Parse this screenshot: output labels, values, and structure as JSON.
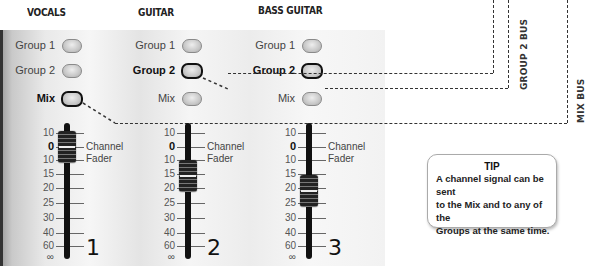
{
  "channels": [
    {
      "title": "VOCALS",
      "number": "1",
      "buttons": [
        {
          "label": "Group 1",
          "active": false
        },
        {
          "label": "Group 2",
          "active": false
        },
        {
          "label": "Mix",
          "active": true
        }
      ],
      "fader_label_line1": "Channel",
      "fader_label_line2": "Fader",
      "fader_position": "0"
    },
    {
      "title": "GUITAR",
      "number": "2",
      "buttons": [
        {
          "label": "Group 1",
          "active": false
        },
        {
          "label": "Group 2",
          "active": true
        },
        {
          "label": "Mix",
          "active": false
        }
      ],
      "fader_label_line1": "Channel",
      "fader_label_line2": "Fader",
      "fader_position": "15"
    },
    {
      "title": "BASS GUITAR",
      "number": "3",
      "buttons": [
        {
          "label": "Group 1",
          "active": false
        },
        {
          "label": "Group 2",
          "active": true
        },
        {
          "label": "Mix",
          "active": false
        }
      ],
      "fader_label_line1": "Channel",
      "fader_label_line2": "Fader",
      "fader_position": "20"
    }
  ],
  "scale": [
    "10",
    "0",
    "10",
    "15",
    "20",
    "25",
    "30",
    "40",
    "60",
    "∞"
  ],
  "buses": {
    "group2": "GROUP 2 BUS",
    "mix": "MIX BUS"
  },
  "tip": {
    "title": "TIP",
    "body_line1": "A channel signal can be sent",
    "body_line2": "to the Mix and to any of the",
    "body_line3": "Groups at the same time."
  }
}
